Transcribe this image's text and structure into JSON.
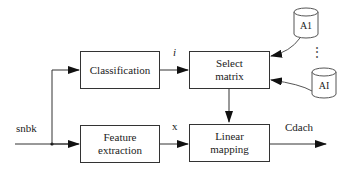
{
  "diagram": {
    "nodes": {
      "classification": {
        "label": "Classification"
      },
      "feature_extraction": {
        "line1": "Feature",
        "line2": "extraction"
      },
      "select_matrix": {
        "line1": "Select",
        "line2": "matrix"
      },
      "linear_mapping": {
        "line1": "Linear",
        "line2": "mapping"
      },
      "storage_top": {
        "label": "A1"
      },
      "storage_bottom": {
        "label": "AI"
      }
    },
    "signals": {
      "input": "snbk",
      "class_index": "i",
      "feature_vector": "x",
      "output": "Cdach"
    },
    "ellipsis": "⋮",
    "edges": [
      {
        "from": "input",
        "to": "classification"
      },
      {
        "from": "input",
        "to": "feature_extraction"
      },
      {
        "from": "classification",
        "to": "select_matrix",
        "label": "i"
      },
      {
        "from": "feature_extraction",
        "to": "linear_mapping",
        "label": "x"
      },
      {
        "from": "select_matrix",
        "to": "linear_mapping"
      },
      {
        "from": "storage_top",
        "to": "select_matrix"
      },
      {
        "from": "storage_bottom",
        "to": "select_matrix"
      },
      {
        "from": "linear_mapping",
        "to": "output",
        "label": "Cdach"
      }
    ]
  }
}
